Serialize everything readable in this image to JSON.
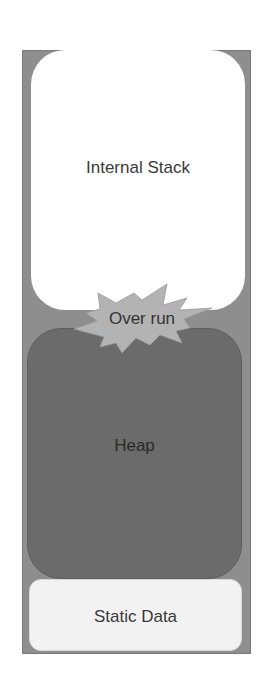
{
  "diagram": {
    "type": "memory-layout",
    "regions": [
      {
        "id": "stack",
        "label": "Internal Stack",
        "fill": "#ffffff"
      },
      {
        "id": "heap",
        "label": "Heap",
        "fill": "#6b6b6b"
      },
      {
        "id": "static",
        "label": "Static Data",
        "fill": "#f2f2f2"
      }
    ],
    "annotation": {
      "label": "Over run",
      "shape": "explosion-burst",
      "fill": "#b0b0b0"
    },
    "frame_color": "#8e8e8e"
  }
}
